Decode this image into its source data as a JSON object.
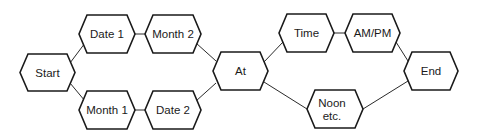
{
  "diagram": {
    "colors": {
      "stroke": "#1a1a1a",
      "fill": "#ffffff",
      "text": "#1a1a1a",
      "background": "#ffffff"
    },
    "nodes": [
      {
        "id": "start",
        "label": [
          "Start"
        ],
        "x1": 20,
        "x2": 75,
        "y1": 54,
        "y2": 91
      },
      {
        "id": "date1",
        "label": [
          "Date 1"
        ],
        "x1": 79,
        "x2": 135,
        "y1": 15,
        "y2": 53
      },
      {
        "id": "month2",
        "label": [
          "Month 2"
        ],
        "x1": 145,
        "x2": 201,
        "y1": 15,
        "y2": 53
      },
      {
        "id": "month1",
        "label": [
          "Month 1"
        ],
        "x1": 79,
        "x2": 135,
        "y1": 91,
        "y2": 129
      },
      {
        "id": "date2",
        "label": [
          "Date 2"
        ],
        "x1": 145,
        "x2": 201,
        "y1": 91,
        "y2": 129
      },
      {
        "id": "at",
        "label": [
          "At"
        ],
        "x1": 213,
        "x2": 268,
        "y1": 52,
        "y2": 90
      },
      {
        "id": "time",
        "label": [
          "Time"
        ],
        "x1": 279,
        "x2": 334,
        "y1": 14,
        "y2": 52
      },
      {
        "id": "ampm",
        "label": [
          "AM/PM"
        ],
        "x1": 345,
        "x2": 400,
        "y1": 14,
        "y2": 52
      },
      {
        "id": "noon",
        "label": [
          "Noon",
          "etc."
        ],
        "x1": 307,
        "x2": 363,
        "y1": 90,
        "y2": 128
      },
      {
        "id": "end",
        "label": [
          "End"
        ],
        "x1": 404,
        "x2": 458,
        "y1": 52,
        "y2": 90
      }
    ],
    "edges": [
      {
        "from": "start",
        "to": "date1",
        "points": [
          70,
          63,
          85,
          43
        ]
      },
      {
        "from": "start",
        "to": "month1",
        "points": [
          70,
          83,
          85,
          101
        ]
      },
      {
        "from": "date1",
        "to": "month2",
        "points": [
          135,
          34,
          145,
          34
        ]
      },
      {
        "from": "month1",
        "to": "date2",
        "points": [
          135,
          110,
          145,
          110
        ]
      },
      {
        "from": "month2",
        "to": "at",
        "points": [
          196,
          43,
          216,
          61
        ]
      },
      {
        "from": "date2",
        "to": "at",
        "points": [
          196,
          101,
          216,
          83
        ]
      },
      {
        "from": "at",
        "to": "time",
        "points": [
          264,
          62,
          283,
          42
        ]
      },
      {
        "from": "at",
        "to": "noon",
        "points": [
          264,
          82,
          307,
          109
        ]
      },
      {
        "from": "time",
        "to": "ampm",
        "points": [
          334,
          33,
          345,
          33
        ]
      },
      {
        "from": "ampm",
        "to": "end",
        "points": [
          396,
          42,
          408,
          61
        ]
      },
      {
        "from": "noon",
        "to": "end",
        "points": [
          363,
          109,
          408,
          81
        ]
      }
    ]
  }
}
